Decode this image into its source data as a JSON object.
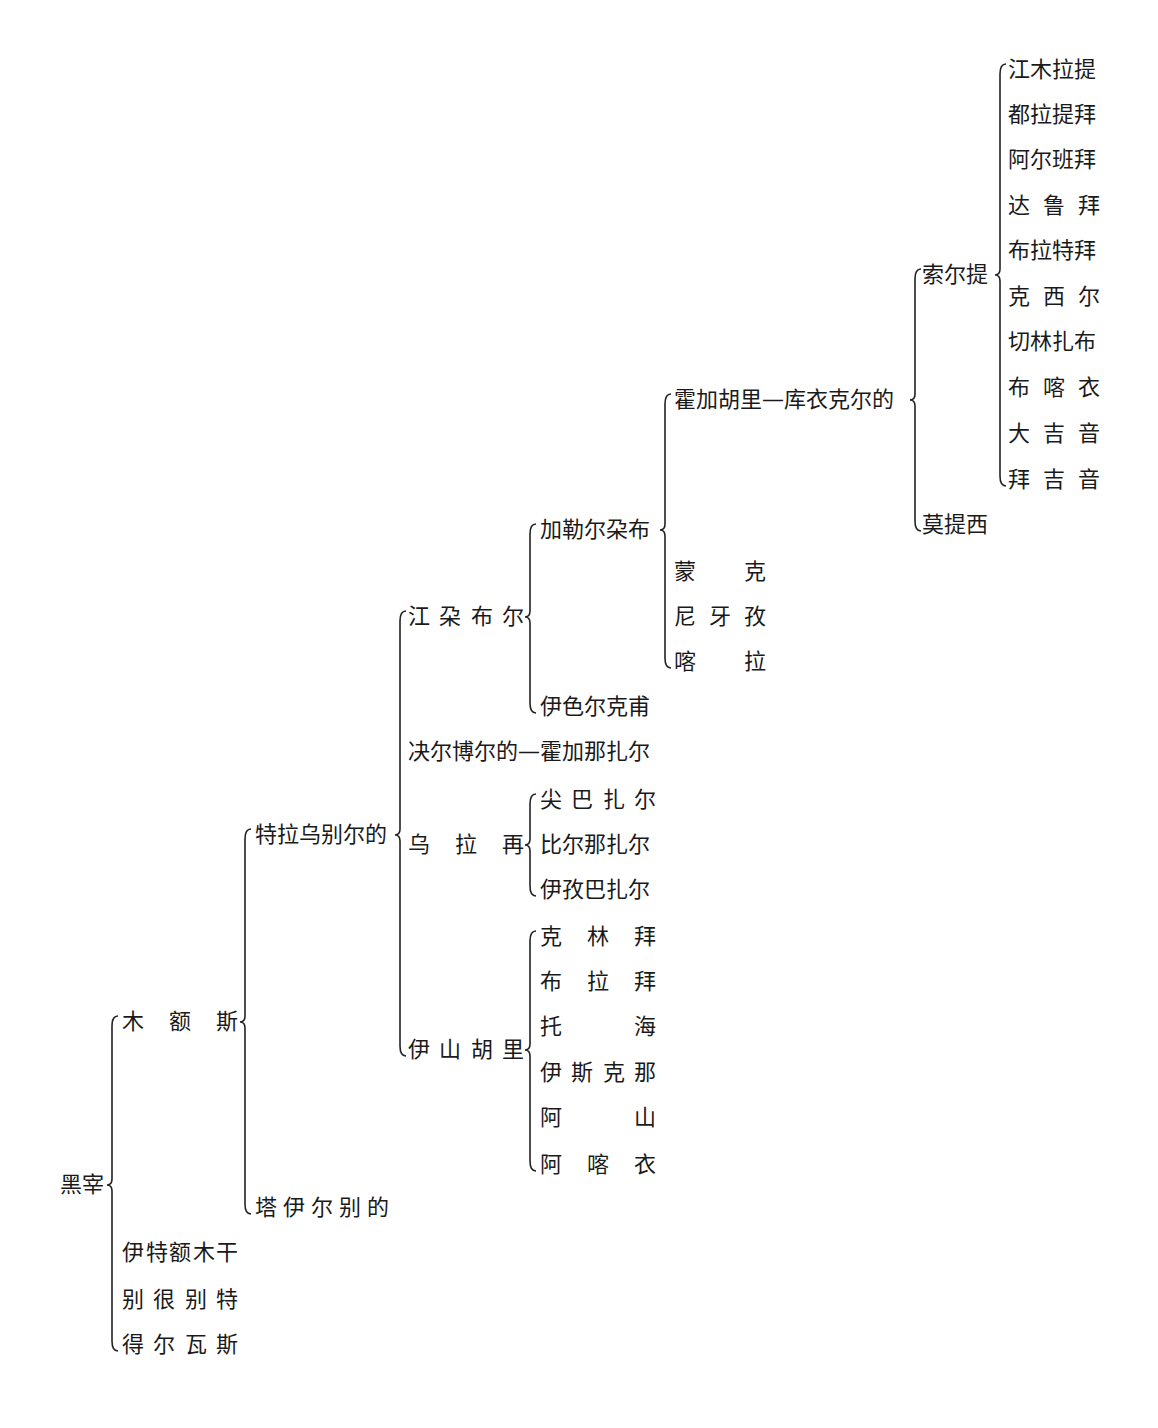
{
  "diagram": {
    "type": "genealogy-tree",
    "ink_color": "#1a1a1a",
    "background": "#ffffff",
    "root": {
      "id": "heizai",
      "label": "黑宰",
      "x": 60,
      "y": 1185,
      "brace_x": 112,
      "children": [
        {
          "id": "mu-e-si",
          "label": "木额斯",
          "spread": [
            "木",
            "额",
            "斯"
          ],
          "width": 116,
          "x": 122,
          "y": 1022,
          "brace_x": 245,
          "children": [
            {
              "id": "tela-wubie-erde",
              "label": "特拉乌别尔的",
              "x": 255,
              "y": 835,
              "brace_x": 400,
              "children": [
                {
                  "id": "jiang-duo-bu-er",
                  "label": "江朶布尔",
                  "spread": [
                    "江",
                    "朶",
                    "布",
                    "尔"
                  ],
                  "width": 116,
                  "x": 408,
                  "y": 617,
                  "brace_x": 530,
                  "children": [
                    {
                      "id": "jialeer-duobu",
                      "label": "加勒尔朶布",
                      "x": 540,
                      "y": 530,
                      "brace_x": 665,
                      "children": [
                        {
                          "id": "huojia-huli-kuyi-keerde",
                          "label": "霍加胡里—库衣克尔的",
                          "x": 674,
                          "y": 400,
                          "brace_x": 915,
                          "children": [
                            {
                              "id": "suoerti",
                              "label": "索尔提",
                              "x": 922,
                              "y": 275,
                              "brace_x": 1000,
                              "children": [
                                {
                                  "id": "jiangmu-lati",
                                  "label": "江木拉提",
                                  "x": 1008,
                                  "y": 70
                                },
                                {
                                  "id": "dula-tibai",
                                  "label": "都拉提拜",
                                  "x": 1008,
                                  "y": 115
                                },
                                {
                                  "id": "aer-banbai",
                                  "label": "阿尔班拜",
                                  "x": 1008,
                                  "y": 160
                                },
                                {
                                  "id": "da-lu-bai",
                                  "label": "达鲁拜",
                                  "spread": [
                                    "达",
                                    "鲁",
                                    "拜"
                                  ],
                                  "width": 92,
                                  "x": 1008,
                                  "y": 206
                                },
                                {
                                  "id": "bula-tebai",
                                  "label": "布拉特拜",
                                  "x": 1008,
                                  "y": 251
                                },
                                {
                                  "id": "ke-xi-er",
                                  "label": "克西尔",
                                  "spread": [
                                    "克",
                                    "西",
                                    "尔"
                                  ],
                                  "width": 92,
                                  "x": 1008,
                                  "y": 297
                                },
                                {
                                  "id": "qielin-zhabu",
                                  "label": "切林扎布",
                                  "x": 1008,
                                  "y": 342
                                },
                                {
                                  "id": "bu-ka-yi",
                                  "label": "布喀衣",
                                  "spread": [
                                    "布",
                                    "喀",
                                    "衣"
                                  ],
                                  "width": 92,
                                  "x": 1008,
                                  "y": 388
                                },
                                {
                                  "id": "da-ji-yin",
                                  "label": "大吉音",
                                  "spread": [
                                    "大",
                                    "吉",
                                    "音"
                                  ],
                                  "width": 92,
                                  "x": 1008,
                                  "y": 434
                                },
                                {
                                  "id": "bai-ji-yin",
                                  "label": "拜吉音",
                                  "spread": [
                                    "拜",
                                    "吉",
                                    "音"
                                  ],
                                  "width": 92,
                                  "x": 1008,
                                  "y": 480
                                }
                              ]
                            },
                            {
                              "id": "motixi",
                              "label": "莫提西",
                              "x": 922,
                              "y": 525
                            }
                          ]
                        },
                        {
                          "id": "meng-ke",
                          "label": "蒙克",
                          "spread": [
                            "蒙",
                            "",
                            "克"
                          ],
                          "width": 92,
                          "x": 674,
                          "y": 572
                        },
                        {
                          "id": "ni-ya-zi",
                          "label": "尼牙孜",
                          "spread": [
                            "尼",
                            "牙",
                            "孜"
                          ],
                          "width": 92,
                          "x": 674,
                          "y": 617
                        },
                        {
                          "id": "ka-la",
                          "label": "喀拉",
                          "spread": [
                            "喀",
                            "",
                            "拉"
                          ],
                          "width": 92,
                          "x": 674,
                          "y": 662
                        }
                      ]
                    },
                    {
                      "id": "yiseer-kefu",
                      "label": "伊色尔克甫",
                      "x": 540,
                      "y": 707
                    }
                  ]
                },
                {
                  "id": "jueer-boerde-huojia-nazhaer",
                  "label": "决尔博尔的—霍加那扎尔",
                  "x": 408,
                  "y": 752
                },
                {
                  "id": "wu-la-zai",
                  "label": "乌拉再",
                  "spread": [
                    "乌",
                    "拉",
                    "再"
                  ],
                  "width": 116,
                  "x": 408,
                  "y": 845,
                  "brace_x": 530,
                  "children": [
                    {
                      "id": "jian-ba-zha-er",
                      "label": "尖巴扎尔",
                      "spread": [
                        "尖",
                        "巴",
                        "扎",
                        "尔"
                      ],
                      "width": 116,
                      "x": 540,
                      "y": 800
                    },
                    {
                      "id": "bier-nazhaer",
                      "label": "比尔那扎尔",
                      "x": 540,
                      "y": 845
                    },
                    {
                      "id": "yizi-bazhaer",
                      "label": "伊孜巴扎尔",
                      "x": 540,
                      "y": 890
                    }
                  ]
                },
                {
                  "id": "yi-shan-hu-li",
                  "label": "伊山胡里",
                  "spread": [
                    "伊",
                    "山",
                    "胡",
                    "里"
                  ],
                  "width": 116,
                  "x": 408,
                  "y": 1050,
                  "brace_x": 530,
                  "children": [
                    {
                      "id": "ke-lin-bai",
                      "label": "克林拜",
                      "spread": [
                        "克",
                        "林",
                        "拜"
                      ],
                      "width": 116,
                      "x": 540,
                      "y": 937
                    },
                    {
                      "id": "bu-la-bai",
                      "label": "布拉拜",
                      "spread": [
                        "布",
                        "拉",
                        "拜"
                      ],
                      "width": 116,
                      "x": 540,
                      "y": 982
                    },
                    {
                      "id": "tuo-hai",
                      "label": "托海",
                      "spread": [
                        "托",
                        "",
                        "海"
                      ],
                      "width": 116,
                      "x": 540,
                      "y": 1027
                    },
                    {
                      "id": "yi-si-ke-na",
                      "label": "伊斯克那",
                      "spread": [
                        "伊",
                        "斯",
                        "克",
                        "那"
                      ],
                      "width": 116,
                      "x": 540,
                      "y": 1073
                    },
                    {
                      "id": "a-shan",
                      "label": "阿山",
                      "spread": [
                        "阿",
                        "",
                        "山"
                      ],
                      "width": 116,
                      "x": 540,
                      "y": 1118
                    },
                    {
                      "id": "a-ka-yi",
                      "label": "阿喀衣",
                      "spread": [
                        "阿",
                        "喀",
                        "衣"
                      ],
                      "width": 116,
                      "x": 540,
                      "y": 1165
                    }
                  ]
                }
              ]
            },
            {
              "id": "ta-yi-er-bie-de",
              "label": "塔伊尔别的",
              "spread": [
                "塔",
                "伊",
                "尔",
                "别",
                "的"
              ],
              "width": 134,
              "x": 255,
              "y": 1208
            }
          ]
        },
        {
          "id": "yite-emugan",
          "label": "伊特额木干",
          "spread": [
            "伊",
            "特",
            "额",
            "木",
            "干"
          ],
          "width": 116,
          "x": 122,
          "y": 1253
        },
        {
          "id": "bie-hen-bie-te",
          "label": "别很别特",
          "spread": [
            "别",
            "很",
            "别",
            "特"
          ],
          "width": 116,
          "x": 122,
          "y": 1300
        },
        {
          "id": "de-er-wa-si",
          "label": "得尔瓦斯",
          "spread": [
            "得",
            "尔",
            "瓦",
            "斯"
          ],
          "width": 116,
          "x": 122,
          "y": 1345
        }
      ]
    }
  }
}
